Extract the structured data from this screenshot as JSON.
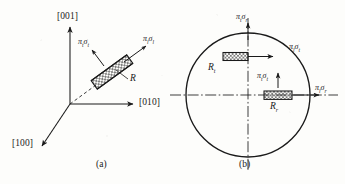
{
  "figure": {
    "kind": "piezoresistance-orientation-diagram",
    "stroke_color": "#1a1a1a",
    "background_color": "#fdfdfb",
    "hatch_color": "#2a2a2a"
  },
  "panel_a": {
    "caption": "(a)",
    "axes": [
      {
        "name": "axis-001",
        "label": "[001]",
        "direction": "up"
      },
      {
        "name": "axis-010",
        "label": "[010]",
        "direction": "right"
      },
      {
        "name": "axis-100",
        "label": "[100]",
        "direction": "down-left"
      }
    ],
    "resistor": {
      "label": "R",
      "style": "cross-hatched-bar",
      "orientation": "tilted-up-right"
    },
    "stress_arrows": [
      {
        "name": "transverse",
        "pi": "π",
        "pi_sub": "t",
        "sigma": "σ",
        "sigma_sub": "t",
        "text": "πtσt",
        "direction": "up-left"
      },
      {
        "name": "longitudinal",
        "pi": "π",
        "pi_sub": "l",
        "sigma": "σ",
        "sigma_sub": "l",
        "text": "πlσl",
        "direction": "up-right"
      }
    ]
  },
  "panel_b": {
    "caption": "(b)",
    "wafer": {
      "shape": "circle",
      "centerlines": "dash-dot"
    },
    "resistors": [
      {
        "label": "R",
        "sub": "t",
        "position": "upper-left-of-vertical-axis"
      },
      {
        "label": "R",
        "sub": "r",
        "position": "right-of-center-on-horizontal-axis"
      }
    ],
    "stress_arrows": [
      {
        "name": "top",
        "text": "πtσr",
        "pi_sub": "t",
        "sigma_sub": "r",
        "direction": "up"
      },
      {
        "name": "upper-right",
        "text": "πlσt",
        "pi_sub": "l",
        "sigma_sub": "t",
        "direction": "right"
      },
      {
        "name": "center",
        "text": "πtσt",
        "pi_sub": "t",
        "sigma_sub": "t",
        "direction": "up"
      },
      {
        "name": "right",
        "text": "πlσr",
        "pi_sub": "l",
        "sigma_sub": "r",
        "direction": "right"
      }
    ]
  }
}
